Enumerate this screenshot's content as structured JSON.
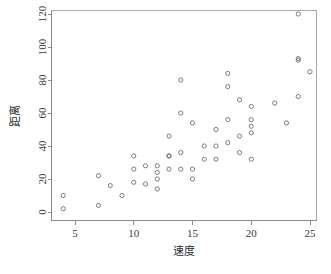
{
  "chart_data": {
    "type": "scatter",
    "title": "",
    "subtitle": "",
    "xlabel": "速度",
    "ylabel": "距离",
    "xlim": [
      3,
      25.5
    ],
    "ylim": [
      -3,
      123
    ],
    "xticks": [
      5,
      10,
      15,
      20,
      25
    ],
    "xtick_labels": [
      "5",
      "10",
      "15",
      "20",
      "25"
    ],
    "yticks": [
      0,
      20,
      40,
      60,
      80,
      100,
      120
    ],
    "ytick_labels": [
      "0",
      "20",
      "40",
      "60",
      "80",
      "100",
      "120"
    ],
    "grid": false,
    "legend": null,
    "marker": "open-circle",
    "marker_color": "#6e6e6e",
    "x": [
      4,
      4,
      7,
      7,
      8,
      9,
      10,
      10,
      10,
      11,
      11,
      12,
      12,
      12,
      12,
      13,
      13,
      13,
      13,
      14,
      14,
      14,
      14,
      15,
      15,
      15,
      16,
      16,
      17,
      17,
      17,
      18,
      18,
      18,
      18,
      19,
      19,
      19,
      20,
      20,
      20,
      20,
      20,
      22,
      23,
      24,
      24,
      24,
      24,
      25
    ],
    "y": [
      2,
      10,
      4,
      22,
      16,
      10,
      18,
      26,
      34,
      17,
      28,
      14,
      20,
      24,
      28,
      26,
      34,
      34,
      46,
      26,
      36,
      60,
      80,
      20,
      26,
      54,
      32,
      40,
      32,
      40,
      50,
      42,
      56,
      76,
      84,
      36,
      46,
      68,
      32,
      48,
      52,
      56,
      64,
      66,
      54,
      70,
      92,
      93,
      120,
      85
    ],
    "series_name": "cars",
    "n_points": 50
  },
  "axes": {
    "x_axis_name": "速度",
    "y_axis_name": "距离"
  }
}
